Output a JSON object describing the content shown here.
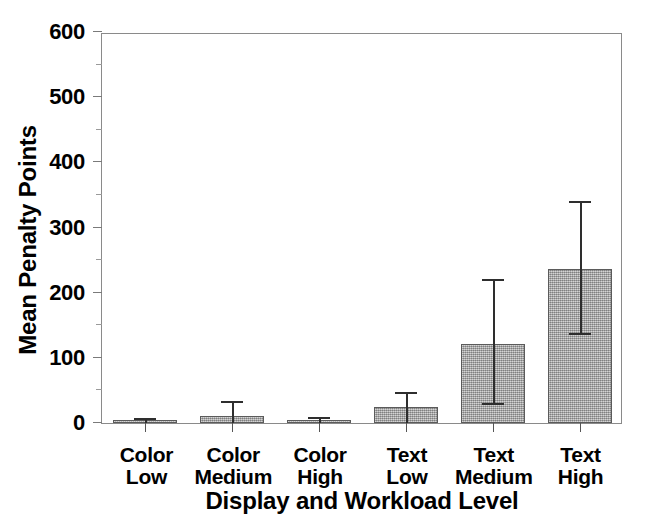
{
  "chart_data": {
    "type": "bar",
    "title": "",
    "xlabel": "Display and Workload Level",
    "ylabel": "Mean Penalty Points",
    "categories": [
      "Color Low",
      "Color Medium",
      "Color High",
      "Text Low",
      "Text Medium",
      "Text High"
    ],
    "category_lines": [
      [
        "Color",
        "Low"
      ],
      [
        "Color",
        "Medium"
      ],
      [
        "Color",
        "High"
      ],
      [
        "Text",
        "Low"
      ],
      [
        "Text",
        "Medium"
      ],
      [
        "Text",
        "High"
      ]
    ],
    "values": [
      2,
      11,
      3,
      25,
      122,
      237
    ],
    "error_high": [
      5,
      30,
      6,
      45,
      218,
      337
    ],
    "error_low": [
      0,
      0,
      0,
      0,
      28,
      135
    ],
    "ylim": [
      0,
      600
    ],
    "ytick_labels": [
      "0",
      "100",
      "200",
      "300",
      "400",
      "500",
      "600"
    ],
    "ytick_values": [
      0,
      100,
      200,
      300,
      400,
      500,
      600
    ],
    "yminor_values": [
      50,
      150,
      250,
      350,
      450,
      550
    ],
    "grid": false,
    "legend": "none",
    "bar_color": "#a9a9a9",
    "bar_edge_color": "#5b5b5b",
    "error_color": "#2e2e2e",
    "axis_color": "#8a8a8a"
  }
}
